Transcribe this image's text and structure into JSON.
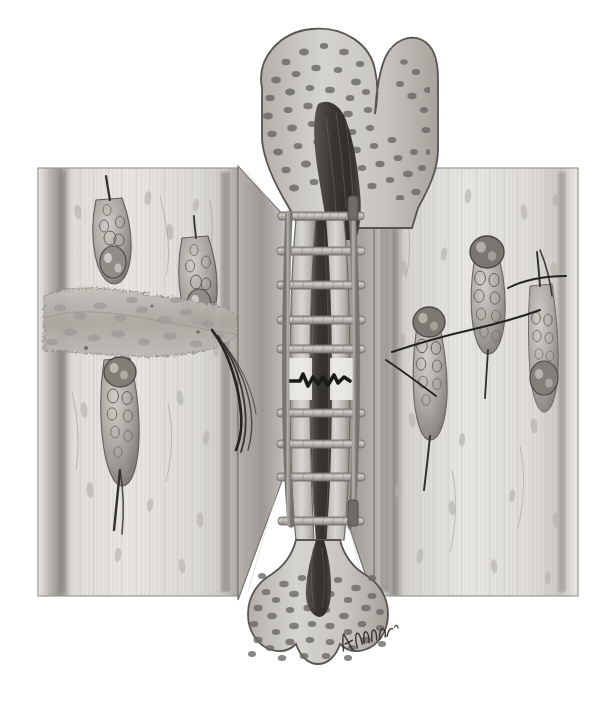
{
  "figure": {
    "medium": "grayscale pen-and-ink / airbrush medical illustration",
    "background_color": "#ffffff",
    "signature": "J.Kolm",
    "width": 612,
    "height": 716
  },
  "palette": {
    "paper": "#ffffff",
    "bone_cortex_light": "#d8d6d2",
    "bone_cortex_mid": "#b4b1ab",
    "bone_cortex_dark": "#8d8a85",
    "trabecular_fill": "#c9c7c2",
    "trabecular_speck": "#6e6b66",
    "marrow_dark": "#3a3733",
    "marrow_mid": "#57534e",
    "scaffold_rail": "#a6a39c",
    "scaffold_rung": "#908d86",
    "panel_field": "#e6e4e0",
    "panel_field_shade": "#cfcdc8",
    "panel_border": "#9a9792",
    "cell_outline": "#57534e",
    "cell_fill": "#b9b6b0",
    "osteoclast_dark": "#5c5854",
    "callus": "#b0ada7",
    "ink_line": "#2b2926",
    "cement_line": "#1f1e1c"
  },
  "main_bone": {
    "name": "femur",
    "label_proximal": "proximal femur (head, neck, greater trochanter)",
    "label_distal": "distal femur (condyles)",
    "label_shaft": "diaphysis / cortical shaft",
    "label_marrow": "medullary canal",
    "fracture": {
      "label": "transverse fracture line",
      "y_position": 381,
      "style": "jagged / zig-zag"
    }
  },
  "scaffold": {
    "name": "ladder-type fixation scaffold",
    "rail_count": 2,
    "rung_count": 9,
    "top_y": 214,
    "bottom_y": 524,
    "rung_ys": [
      216,
      250,
      285,
      320,
      349,
      413,
      444,
      477,
      521
    ],
    "note": "helical-wound rails with transverse rungs spanning the fracture"
  },
  "panels": [
    {
      "id": "left-panel",
      "name": "left inset — callus and cutting cones",
      "x": 38,
      "y": 168,
      "w": 200,
      "h": 428,
      "contents": [
        "woven-bone callus mass (horizontal band)",
        "cutting cone with osteoclast head",
        "trailing osteoblast / osteocyte chain",
        "haversian canal resorption front",
        "lacunae with osteocytes in lamellar bone",
        "longitudinal lamellae striations"
      ],
      "cutting_cones": 3,
      "callus_band": {
        "label": "callus",
        "y": 290,
        "h": 66
      }
    },
    {
      "id": "right-panel",
      "name": "right inset — remodeling units and cement lines",
      "x": 374,
      "y": 168,
      "w": 204,
      "h": 428,
      "contents": [
        "cutting cone with osteoclast head",
        "osteoblast chains lining resorption tunnel",
        "cement lines / reversal lines",
        "osteocyte lacunae in lamellar bone",
        "longitudinal lamellae striations"
      ],
      "cutting_cones": 3,
      "cement_lines": 3
    }
  ],
  "wedges": {
    "name": "cut-away wedges",
    "description": "two triangular cortical cut-away wedges flanking the shaft linking the insets to the fracture site",
    "count": 2
  },
  "annotations": {
    "trailing_filaments": "fine dark filaments trailing from left callus toward the shaft"
  }
}
